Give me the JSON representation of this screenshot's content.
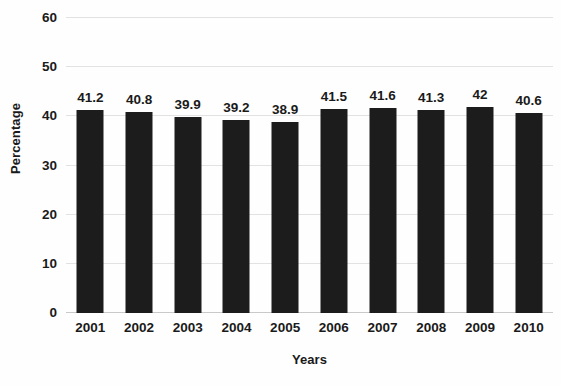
{
  "chart_data": {
    "type": "bar",
    "title": "",
    "xlabel": "Years",
    "ylabel": "Percentage",
    "categories": [
      "2001",
      "2002",
      "2003",
      "2004",
      "2005",
      "2006",
      "2007",
      "2008",
      "2009",
      "2010"
    ],
    "values": [
      41.2,
      40.8,
      39.9,
      39.2,
      38.9,
      41.5,
      41.6,
      41.3,
      42,
      40.6
    ],
    "value_labels": [
      "41.2",
      "40.8",
      "39.9",
      "39.2",
      "38.9",
      "41.5",
      "41.6",
      "41.3",
      "42",
      "40.6"
    ],
    "ylim": [
      0,
      60
    ],
    "y_ticks": [
      0,
      10,
      20,
      30,
      40,
      50,
      60
    ],
    "y_tick_labels": [
      "0",
      "10",
      "20",
      "30",
      "40",
      "50",
      "60"
    ],
    "grid": true,
    "legend": false,
    "legend_position": "none",
    "bar_color": "#1c1c1c",
    "gridline_color": "#e2e2e2",
    "background_color": "#fefefe",
    "text_color": "#1a1a1a"
  }
}
